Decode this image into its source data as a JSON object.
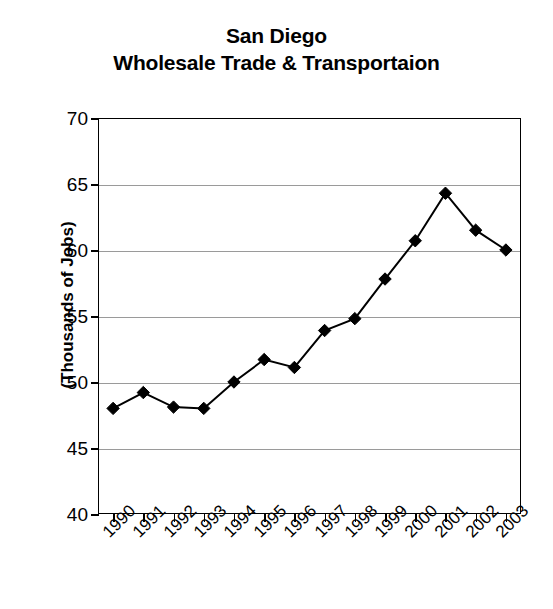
{
  "title": {
    "line1": "San Diego",
    "line2": "Wholesale Trade & Transportaion"
  },
  "axes": {
    "ylabel": "(Thousands of Jobs)",
    "xlabel": ""
  },
  "chart_data": {
    "type": "line",
    "title": "San Diego Wholesale Trade & Transportaion",
    "xlabel": "",
    "ylabel": "(Thousands of Jobs)",
    "categories": [
      "1990",
      "1991",
      "1992",
      "1993",
      "1994",
      "1995",
      "1996",
      "1997",
      "1998",
      "1999",
      "2000",
      "2001",
      "2002",
      "2003"
    ],
    "values": [
      48.0,
      49.2,
      48.1,
      48.0,
      50.0,
      51.7,
      51.1,
      53.9,
      54.8,
      57.8,
      60.7,
      64.3,
      61.5,
      60.0
    ],
    "ylim": [
      40,
      70
    ],
    "yticks": [
      40,
      45,
      50,
      55,
      60,
      65,
      70
    ],
    "ytick_labels": [
      "40",
      "45",
      "50",
      "55",
      "60",
      "65",
      "70"
    ],
    "grid": true,
    "legend": "none",
    "marker": "diamond",
    "line_color": "#000000",
    "marker_color": "#000000",
    "grid_color": "#9a9a9a",
    "background": "#ffffff"
  }
}
